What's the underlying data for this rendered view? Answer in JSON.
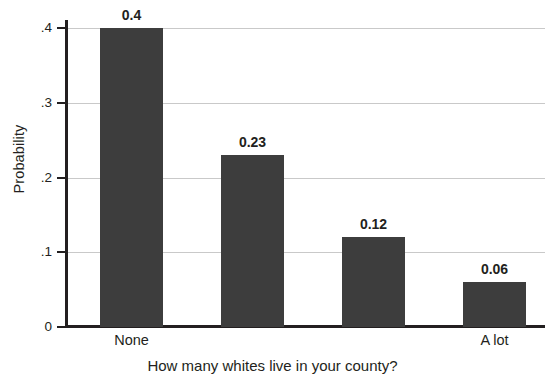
{
  "chart_data": {
    "type": "bar",
    "title": "",
    "subtitle": "",
    "xlabel": "How many whites live in your county?",
    "ylabel": "Probability",
    "categories": [
      "None",
      "",
      "",
      "A lot"
    ],
    "values": [
      0.4,
      0.23,
      0.12,
      0.06
    ],
    "data_labels": [
      "0.4",
      "0.23",
      "0.12",
      "0.06"
    ],
    "ylim": [
      0,
      0.4
    ],
    "yticks": [
      0,
      0.1,
      0.2,
      0.3,
      0.4
    ],
    "ytick_labels": [
      "0",
      ".1",
      ".2",
      ".3",
      ".4"
    ],
    "xtick_labels": [
      "None",
      "A lot"
    ],
    "grid": true,
    "legend": null,
    "colors": {
      "bar": "#3d3d3d",
      "axis": "#231f20",
      "gridline": "#c9c9c9",
      "text": "#231f20",
      "background": "#ffffff"
    }
  }
}
